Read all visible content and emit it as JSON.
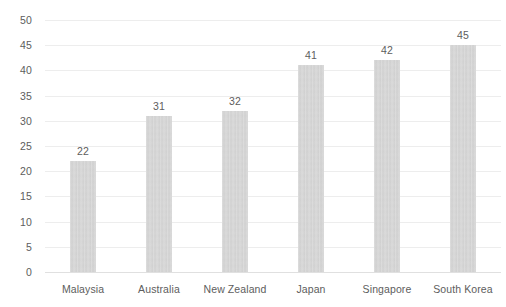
{
  "chart_data": {
    "type": "bar",
    "title": "",
    "subtitle": "",
    "xlabel": "",
    "ylabel": "",
    "categories": [
      "Malaysia",
      "Australia",
      "New Zealand",
      "Japan",
      "Singapore",
      "South Korea"
    ],
    "values": [
      22,
      31,
      32,
      41,
      42,
      45
    ],
    "data_labels": [
      "22",
      "31",
      "32",
      "41",
      "42",
      "45"
    ],
    "ylim": [
      0,
      50
    ],
    "ytick_step": 5,
    "ytick_labels": [
      "50",
      "45",
      "40",
      "35",
      "30",
      "25",
      "20",
      "15",
      "10",
      "5",
      "0"
    ],
    "ytick_values": [
      50,
      45,
      40,
      35,
      30,
      25,
      20,
      15,
      10,
      5,
      0
    ],
    "grid": true,
    "grid_axis": "y",
    "legend": false,
    "legend_position": "none",
    "series": [
      {
        "name": "",
        "values": [
          22,
          31,
          32,
          41,
          42,
          45
        ]
      }
    ],
    "colors": {
      "bar_fill": "#d2d2d2",
      "gridline": "#ededed",
      "axis_line": "#e0e0e0",
      "text": "#5d5d5d",
      "background": "#ffffff"
    }
  }
}
